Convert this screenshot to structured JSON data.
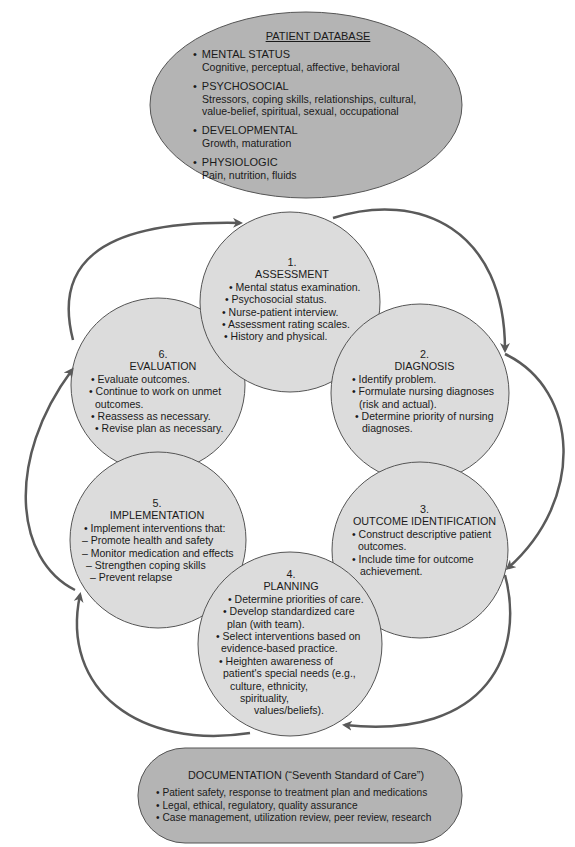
{
  "patient_database": {
    "title": "PATIENT DATABASE",
    "items": [
      {
        "heading": "MENTAL STATUS",
        "lines": [
          "Cognitive, perceptual, affective, behavioral"
        ]
      },
      {
        "heading": "PSYCHOSOCIAL",
        "lines": [
          "Stressors, coping skills, relationships, cultural,",
          "value-belief, spiritual, sexual, occupational"
        ]
      },
      {
        "heading": "DEVELOPMENTAL",
        "lines": [
          "Growth, maturation"
        ]
      },
      {
        "heading": "PHYSIOLOGIC",
        "lines": [
          "Pain, nutrition, fluids"
        ]
      }
    ]
  },
  "steps": [
    {
      "number": "1.",
      "name": "ASSESSMENT",
      "lines": [
        "• Mental status examination.",
        "• Psychosocial status.",
        "• Nurse-patient interview.",
        "• Assessment rating scales.",
        "• History and physical."
      ]
    },
    {
      "number": "2.",
      "name": "DIAGNOSIS",
      "lines": [
        "• Identify problem.",
        "• Formulate nursing diagnoses",
        "  (risk and actual).",
        "• Determine priority of nursing",
        "  diagnoses."
      ]
    },
    {
      "number": "3.",
      "name": "OUTCOME IDENTIFICATION",
      "lines": [
        "• Construct descriptive patient",
        "  outcomes.",
        "• Include time for outcome",
        "  achievement."
      ]
    },
    {
      "number": "4.",
      "name": "PLANNING",
      "lines": [
        "• Determine priorities of care.",
        "• Develop standardized care",
        "plan (with team).",
        "• Select interventions based on",
        "evidence-based practice.",
        "• Heighten awareness of",
        "patient's special needs (e.g.,",
        "culture, ethnicity,",
        "spirituality,",
        "values/beliefs)."
      ]
    },
    {
      "number": "5.",
      "name": "IMPLEMENTATION",
      "lines": [
        "• Implement interventions that:",
        "– Promote health and safety",
        "– Monitor medication and effects",
        "– Strengthen coping skills",
        "– Prevent relapse"
      ]
    },
    {
      "number": "6.",
      "name": "EVALUATION",
      "lines": [
        "• Evaluate outcomes.",
        "• Continue to work on unmet",
        "  outcomes.",
        "• Reassess as necessary.",
        "• Revise plan as necessary."
      ]
    }
  ],
  "documentation": {
    "title": "DOCUMENTATION (“Seventh Standard of Care”)",
    "lines": [
      "• Patient safety, response to treatment plan and medications",
      "• Legal, ethical, regulatory, quality assurance",
      "• Case management, utilization review, peer review, research"
    ]
  },
  "colors": {
    "ellipse_fill": "#b4b4b4",
    "circle_fill": "#dcdcdc",
    "stroke": "#555555",
    "arrow": "#5a5a5a"
  }
}
